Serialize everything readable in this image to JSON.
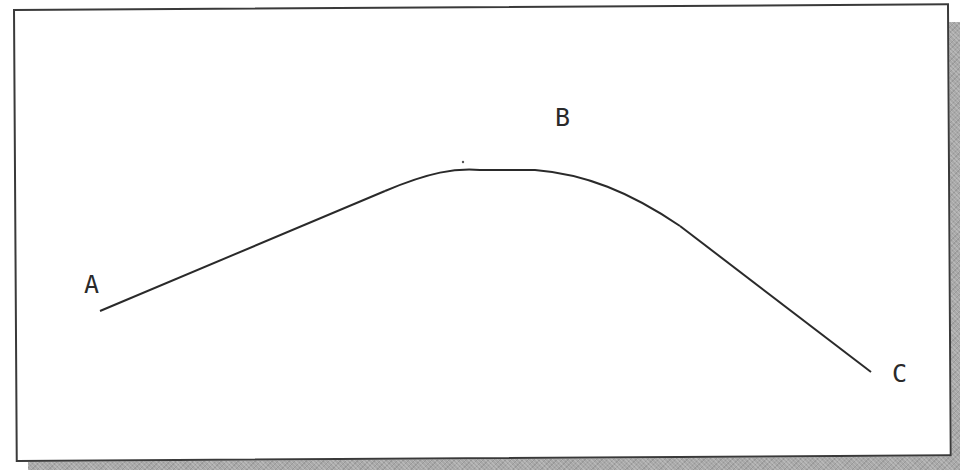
{
  "diagram": {
    "type": "curve-path",
    "colors": {
      "background": "#ffffff",
      "stroke": "#2a2a2a",
      "frame_border": "#3a3a3a",
      "shadow": "#a9a9a9"
    },
    "points": [
      {
        "id": "A",
        "label": "A",
        "x": 100,
        "y": 311,
        "label_x": 84,
        "label_y": 272
      },
      {
        "id": "B",
        "label": "B",
        "x": 505,
        "y": 170,
        "label_x": 555,
        "label_y": 105
      },
      {
        "id": "C",
        "label": "C",
        "x": 871,
        "y": 372,
        "label_x": 892,
        "label_y": 361
      }
    ],
    "segments": [
      {
        "kind": "line",
        "from": [
          100,
          311
        ],
        "to": [
          385,
          191
        ]
      },
      {
        "kind": "arc",
        "from": [
          385,
          191
        ],
        "control": [
          500,
          150
        ],
        "to": [
          680,
          226
        ]
      },
      {
        "kind": "line",
        "from": [
          680,
          226
        ],
        "to": [
          871,
          372
        ]
      }
    ],
    "stray_mark": {
      "x": 463,
      "y": 162
    }
  }
}
